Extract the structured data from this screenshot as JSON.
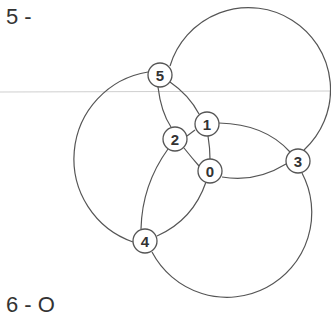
{
  "figure": {
    "label_top": "5 -",
    "label_bottom": "6 - O",
    "colors": {
      "line": "#555555",
      "node_fill": "#ffffff",
      "text": "#333333",
      "rule": "#cccccc"
    }
  },
  "nodes": [
    {
      "id": "0",
      "x": 210,
      "y": 171
    },
    {
      "id": "1",
      "x": 207,
      "y": 124
    },
    {
      "id": "2",
      "x": 175,
      "y": 139
    },
    {
      "id": "3",
      "x": 298,
      "y": 161
    },
    {
      "id": "4",
      "x": 145,
      "y": 241
    },
    {
      "id": "5",
      "x": 160,
      "y": 75
    }
  ],
  "edges": [
    [
      "5",
      "2"
    ],
    [
      "5",
      "1"
    ],
    [
      "2",
      "1"
    ],
    [
      "2",
      "0"
    ],
    [
      "1",
      "0"
    ],
    [
      "1",
      "3"
    ],
    [
      "0",
      "3"
    ],
    [
      "2",
      "4"
    ],
    [
      "0",
      "4"
    ],
    [
      "5",
      "4"
    ],
    [
      "5",
      "3"
    ],
    [
      "4",
      "3"
    ]
  ]
}
